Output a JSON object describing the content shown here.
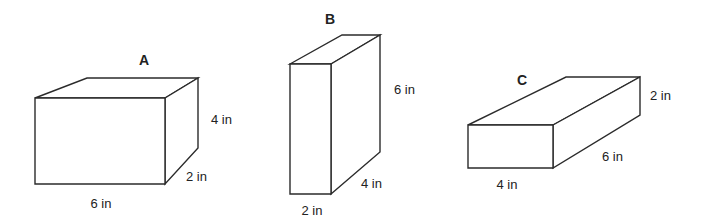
{
  "diagram": {
    "type": "rectangular-prisms",
    "colors": {
      "edge": "#2b2b2b",
      "text": "#222222",
      "background": "#ffffff"
    },
    "boxes": [
      {
        "id": "A",
        "title": "A",
        "dimensions": {
          "length": "6 in",
          "width": "2 in",
          "height": "4 in"
        },
        "labels": {
          "bottom": "6 in",
          "depth": "2 in",
          "side": "4 in"
        }
      },
      {
        "id": "B",
        "title": "B",
        "dimensions": {
          "length": "2 in",
          "width": "4 in",
          "height": "6 in"
        },
        "labels": {
          "bottom": "2 in",
          "depth": "4 in",
          "side": "6 in"
        }
      },
      {
        "id": "C",
        "title": "C",
        "dimensions": {
          "length": "4 in",
          "width": "6 in",
          "height": "2 in"
        },
        "labels": {
          "bottom": "4 in",
          "depth": "6 in",
          "side": "2 in"
        }
      }
    ]
  }
}
